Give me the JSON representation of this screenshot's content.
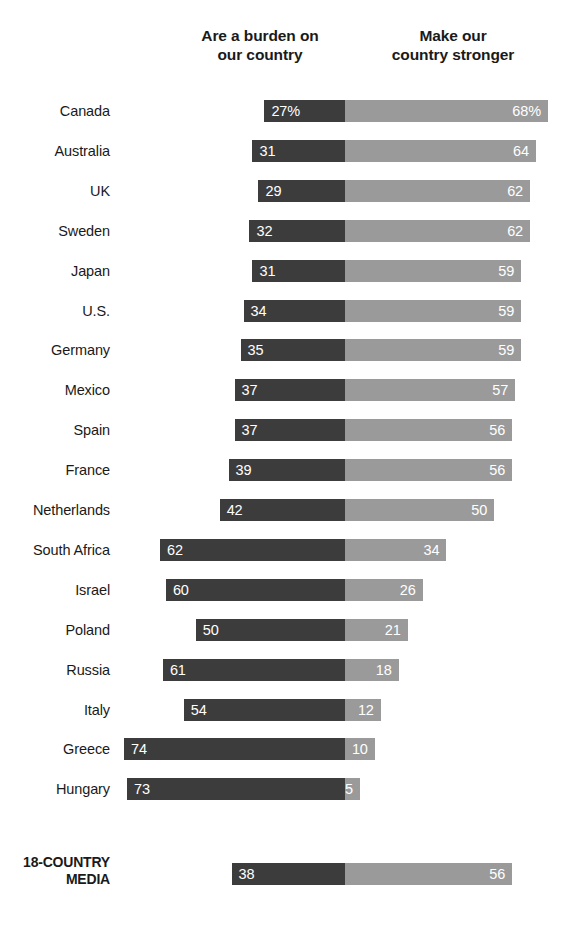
{
  "headers": {
    "left": {
      "line1": "Are a burden on",
      "line2": "our country"
    },
    "right": {
      "line1": "Make our",
      "line2": "country stronger"
    }
  },
  "colors": {
    "burden": "#3c3c3c",
    "stronger": "#9a9a9a",
    "background": "#ffffff",
    "text": "#1a1a1a",
    "value_text": "#ffffff"
  },
  "summary_row": {
    "label_line1": "18-COUNTRY",
    "label_line2": "MEDIA"
  },
  "chart_data": {
    "type": "bar",
    "subtype": "diverging-stacked-bar",
    "title": "",
    "subtitle": "",
    "xlabel": "",
    "ylabel": "",
    "grid": false,
    "legend_position": "top",
    "legend": [
      "Are a burden on our country",
      "Make our country stronger"
    ],
    "axis_note": "Diverging bars centered on a shared baseline; left series extends leftward, right series extends rightward.",
    "categories": [
      "Canada",
      "Australia",
      "UK",
      "Sweden",
      "Japan",
      "U.S.",
      "Germany",
      "Mexico",
      "Spain",
      "France",
      "Netherlands",
      "South Africa",
      "Israel",
      "Poland",
      "Russia",
      "Italy",
      "Greece",
      "Hungary"
    ],
    "series": [
      {
        "name": "Are a burden on our country",
        "color": "#3c3c3c",
        "values": [
          27,
          31,
          29,
          32,
          31,
          34,
          35,
          37,
          37,
          39,
          42,
          62,
          60,
          50,
          61,
          54,
          74,
          73
        ]
      },
      {
        "name": "Make our country stronger",
        "color": "#9a9a9a",
        "values": [
          68,
          64,
          62,
          62,
          59,
          59,
          59,
          57,
          56,
          56,
          50,
          34,
          26,
          21,
          18,
          12,
          10,
          5
        ]
      }
    ],
    "labels": [
      {
        "left": "27%",
        "right": "68%"
      },
      {
        "left": "31",
        "right": "64"
      },
      {
        "left": "29",
        "right": "62"
      },
      {
        "left": "32",
        "right": "62"
      },
      {
        "left": "31",
        "right": "59"
      },
      {
        "left": "34",
        "right": "59"
      },
      {
        "left": "35",
        "right": "59"
      },
      {
        "left": "37",
        "right": "57"
      },
      {
        "left": "37",
        "right": "56"
      },
      {
        "left": "39",
        "right": "56"
      },
      {
        "left": "42",
        "right": "50"
      },
      {
        "left": "62",
        "right": "34"
      },
      {
        "left": "60",
        "right": "26"
      },
      {
        "left": "50",
        "right": "21"
      },
      {
        "left": "61",
        "right": "18"
      },
      {
        "left": "54",
        "right": "12"
      },
      {
        "left": "74",
        "right": "10"
      },
      {
        "left": "73",
        "right": "5"
      }
    ],
    "summary": {
      "category": "18-COUNTRY MEDIA",
      "left_value": 38,
      "right_value": 56,
      "left_label": "38",
      "right_label": "56"
    }
  },
  "layout": {
    "divider_x": 345,
    "px_per_unit": 2.985,
    "first_row_top": 99,
    "row_pitch": 39.9,
    "summary_row_top": 862
  }
}
